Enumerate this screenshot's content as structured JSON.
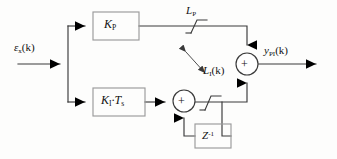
{
  "diagram": {
    "type": "block-diagram",
    "colors": {
      "line": "#3a3a3a",
      "box_border": "#9a9a9a",
      "text": "#111111",
      "background": "#fdfdfc",
      "arrowhead": "#000000"
    },
    "signals": {
      "input": "εx(k)",
      "input_base": "ε",
      "input_sub": "x",
      "input_tail": "(k)",
      "output_base": "y",
      "output_sub": "PI",
      "output_tail": "(k)",
      "proportional_path_label": "L",
      "proportional_path_sub": "P",
      "integral_path_label": "L",
      "integral_path_sub": "I",
      "integral_path_tail": "(k)"
    },
    "blocks": [
      {
        "id": "gain-proportional",
        "label_base": "K",
        "label_sub": "P",
        "label_tail": "",
        "x": 93,
        "y": 12,
        "w": 46,
        "h": 28
      },
      {
        "id": "gain-integral",
        "label_base": "K",
        "label_sub": "I",
        "label_tail": "·T",
        "label_tail_sub": "s",
        "x": 93,
        "y": 88,
        "w": 52,
        "h": 28
      },
      {
        "id": "unit-delay",
        "label_base": "Z",
        "label_sup": "-1",
        "x": 195,
        "y": 124,
        "w": 36,
        "h": 24
      }
    ],
    "summing_junctions": [
      {
        "id": "sum-right",
        "sign": "+",
        "cx": 247,
        "cy": 64,
        "r": 11
      },
      {
        "id": "sum-lower",
        "sign": "+",
        "cx": 184,
        "cy": 101,
        "r": 11
      }
    ],
    "annotation": {
      "double_arrow": "double-headed diagonal arrow linking L_P and L_I(k)"
    }
  }
}
